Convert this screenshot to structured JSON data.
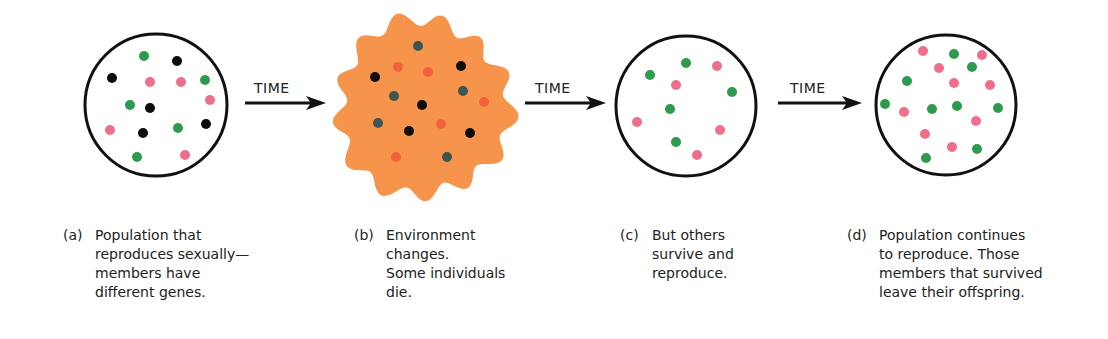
{
  "figure": {
    "colors": {
      "green": "#2e9a4e",
      "pink": "#ee6f8c",
      "black": "#0d0d0d",
      "dark_teal": "#3f5552",
      "orange_red": "#f4623d",
      "environment_fill": "#f7944c",
      "outline": "#111111"
    },
    "arrows": [
      {
        "label": "TIME"
      },
      {
        "label": "TIME"
      },
      {
        "label": "TIME"
      }
    ],
    "panels": [
      {
        "id": "a",
        "tag": "(a)",
        "caption_lines": [
          "Population that",
          "reproduces sexually—",
          "members have",
          "different genes."
        ],
        "shape": "circle",
        "center": [
          156,
          105
        ],
        "radius": 71,
        "dots": [
          {
            "x": 144,
            "y": 56,
            "color": "green"
          },
          {
            "x": 205,
            "y": 80,
            "color": "green"
          },
          {
            "x": 130,
            "y": 105,
            "color": "green"
          },
          {
            "x": 178,
            "y": 128,
            "color": "green"
          },
          {
            "x": 137,
            "y": 157,
            "color": "green"
          },
          {
            "x": 177,
            "y": 61,
            "color": "black"
          },
          {
            "x": 112,
            "y": 78,
            "color": "black"
          },
          {
            "x": 150,
            "y": 108,
            "color": "black"
          },
          {
            "x": 143,
            "y": 133,
            "color": "black"
          },
          {
            "x": 206,
            "y": 124,
            "color": "black"
          },
          {
            "x": 150,
            "y": 82,
            "color": "pink"
          },
          {
            "x": 181,
            "y": 82,
            "color": "pink"
          },
          {
            "x": 210,
            "y": 100,
            "color": "pink"
          },
          {
            "x": 110,
            "y": 130,
            "color": "pink"
          },
          {
            "x": 185,
            "y": 155,
            "color": "pink"
          }
        ]
      },
      {
        "id": "b",
        "tag": "(b)",
        "caption_lines": [
          "Environment",
          "changes.",
          "Some individuals",
          "die."
        ],
        "shape": "wavy-blob",
        "center": [
          423,
          108
        ],
        "radius": 86,
        "dots": [
          {
            "x": 418,
            "y": 46,
            "color": "dark_teal"
          },
          {
            "x": 394,
            "y": 96,
            "color": "dark_teal"
          },
          {
            "x": 463,
            "y": 91,
            "color": "dark_teal"
          },
          {
            "x": 378,
            "y": 123,
            "color": "dark_teal"
          },
          {
            "x": 447,
            "y": 157,
            "color": "dark_teal"
          },
          {
            "x": 375,
            "y": 77,
            "color": "black"
          },
          {
            "x": 461,
            "y": 66,
            "color": "black"
          },
          {
            "x": 422,
            "y": 105,
            "color": "black"
          },
          {
            "x": 409,
            "y": 131,
            "color": "black"
          },
          {
            "x": 470,
            "y": 133,
            "color": "black"
          },
          {
            "x": 398,
            "y": 67,
            "color": "orange_red"
          },
          {
            "x": 428,
            "y": 72,
            "color": "orange_red"
          },
          {
            "x": 484,
            "y": 102,
            "color": "orange_red"
          },
          {
            "x": 441,
            "y": 124,
            "color": "orange_red"
          },
          {
            "x": 396,
            "y": 157,
            "color": "orange_red"
          }
        ]
      },
      {
        "id": "c",
        "tag": "(c)",
        "caption_lines": [
          "But others",
          "survive and",
          "reproduce."
        ],
        "shape": "circle",
        "center": [
          686,
          106
        ],
        "radius": 70,
        "dots": [
          {
            "x": 686,
            "y": 63,
            "color": "green"
          },
          {
            "x": 650,
            "y": 75,
            "color": "green"
          },
          {
            "x": 732,
            "y": 92,
            "color": "green"
          },
          {
            "x": 670,
            "y": 109,
            "color": "green"
          },
          {
            "x": 676,
            "y": 142,
            "color": "green"
          },
          {
            "x": 717,
            "y": 66,
            "color": "pink"
          },
          {
            "x": 676,
            "y": 85,
            "color": "pink"
          },
          {
            "x": 637,
            "y": 122,
            "color": "pink"
          },
          {
            "x": 720,
            "y": 130,
            "color": "pink"
          },
          {
            "x": 697,
            "y": 155,
            "color": "pink"
          }
        ]
      },
      {
        "id": "d",
        "tag": "(d)",
        "caption_lines": [
          "Population continues",
          "to reproduce.  Those",
          "members that survived",
          "leave their offspring."
        ],
        "shape": "circle",
        "center": [
          946,
          105
        ],
        "radius": 70,
        "dots": [
          {
            "x": 954,
            "y": 54,
            "color": "green"
          },
          {
            "x": 972,
            "y": 67,
            "color": "green"
          },
          {
            "x": 907,
            "y": 81,
            "color": "green"
          },
          {
            "x": 885,
            "y": 104,
            "color": "green"
          },
          {
            "x": 932,
            "y": 109,
            "color": "green"
          },
          {
            "x": 957,
            "y": 106,
            "color": "green"
          },
          {
            "x": 998,
            "y": 108,
            "color": "green"
          },
          {
            "x": 926,
            "y": 158,
            "color": "green"
          },
          {
            "x": 977,
            "y": 149,
            "color": "green"
          },
          {
            "x": 923,
            "y": 51,
            "color": "pink"
          },
          {
            "x": 982,
            "y": 55,
            "color": "pink"
          },
          {
            "x": 939,
            "y": 68,
            "color": "pink"
          },
          {
            "x": 954,
            "y": 83,
            "color": "pink"
          },
          {
            "x": 990,
            "y": 85,
            "color": "pink"
          },
          {
            "x": 904,
            "y": 112,
            "color": "pink"
          },
          {
            "x": 976,
            "y": 121,
            "color": "pink"
          },
          {
            "x": 925,
            "y": 134,
            "color": "pink"
          },
          {
            "x": 952,
            "y": 147,
            "color": "pink"
          }
        ]
      }
    ]
  }
}
